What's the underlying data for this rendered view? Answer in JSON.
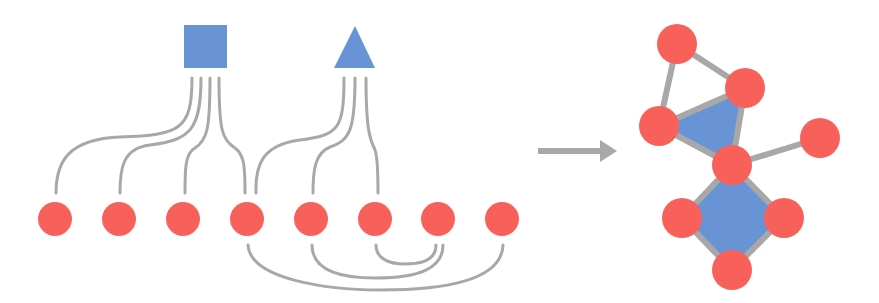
{
  "colors": {
    "node": "#f8615a",
    "hyperedge": "#6894d6",
    "edge": "#a8a8a8",
    "arrow": "#a8a8a8",
    "background": "#ffffff"
  },
  "left_diagram": {
    "hyperedges": [
      {
        "shape": "square",
        "connects_to_nodes": [
          1,
          2,
          3,
          4
        ]
      },
      {
        "shape": "triangle",
        "connects_to_nodes": [
          4,
          5,
          6
        ]
      }
    ],
    "nodes": [
      1,
      2,
      3,
      4,
      5,
      6,
      7,
      8
    ],
    "pairwise_edges": [
      [
        4,
        8
      ],
      [
        5,
        7
      ],
      [
        6,
        7
      ]
    ]
  },
  "arrow": {
    "direction": "right"
  },
  "right_diagram": {
    "node_count": 9,
    "filled_faces": [
      "triangle",
      "square"
    ]
  }
}
